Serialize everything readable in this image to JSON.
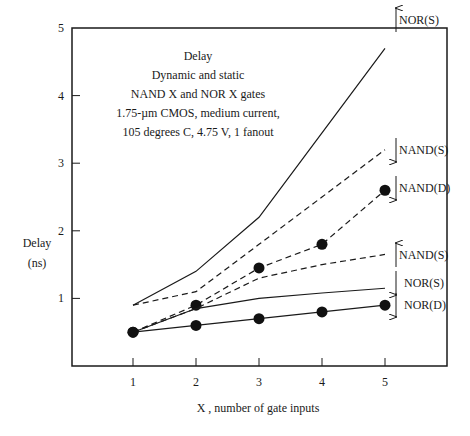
{
  "chart_data": {
    "type": "line",
    "title": [
      "Delay",
      "Dynamic and static",
      "NAND X and NOR X gates",
      "1.75-µm CMOS, medium current,",
      "105 degrees C, 4.75 V, 1 fanout"
    ],
    "xlabel": "X , number of gate inputs",
    "ylabel": [
      "Delay",
      "(ns)"
    ],
    "x": [
      1,
      2,
      3,
      4,
      5
    ],
    "xticks": [
      "1",
      "2",
      "3",
      "4",
      "5"
    ],
    "yticks": [
      "1",
      "2",
      "3",
      "4",
      "5"
    ],
    "xlim": [
      0,
      6
    ],
    "ylim": [
      0,
      5
    ],
    "grid": false,
    "series": [
      {
        "name": "NOR(S)",
        "label": "NOR(S)",
        "style": "solid",
        "markers": false,
        "arrow": "up",
        "values": [
          0.9,
          1.4,
          2.2,
          3.45,
          4.7
        ]
      },
      {
        "name": "NAND(S)",
        "label": "NAND(S)",
        "style": "dashed",
        "markers": false,
        "arrow": "down",
        "values": [
          0.9,
          1.1,
          1.8,
          2.5,
          3.2
        ]
      },
      {
        "name": "NAND(D)",
        "label": "NAND(D)",
        "style": "dashed",
        "markers": true,
        "arrow": "down",
        "values": [
          0.5,
          0.9,
          1.45,
          1.8,
          2.6
        ]
      },
      {
        "name": "NAND(S)",
        "label": "NAND(S)",
        "style": "dashed",
        "markers": false,
        "arrow": "up",
        "values": [
          0.5,
          0.85,
          1.3,
          1.5,
          1.65
        ]
      },
      {
        "name": "NOR(S)",
        "label": "NOR(S)",
        "style": "solid",
        "markers": false,
        "arrow": "down",
        "values": [
          0.5,
          0.85,
          1.0,
          1.08,
          1.15
        ]
      },
      {
        "name": "NOR(D)",
        "label": "NOR(D)",
        "style": "solid",
        "markers": true,
        "arrow": "down",
        "values": [
          0.5,
          0.6,
          0.7,
          0.8,
          0.9
        ]
      }
    ]
  }
}
